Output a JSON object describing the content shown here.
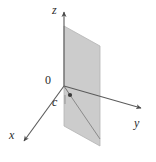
{
  "figure": {
    "kind": "3d-coordinate-plane-diagram",
    "background_color": "#ffffff",
    "stroke_color": "#5a5a5a",
    "label_color": "#2b2b2b",
    "plane_fill_color": "#c9c9c9",
    "plane_edge_color": "#b0b0b0",
    "labels": {
      "z_axis": "z",
      "y_axis": "y",
      "x_axis": "x",
      "origin": "0",
      "point_c": "c"
    },
    "geometry": {
      "origin_px": [
        64,
        86
      ],
      "z_axis_tip_px": [
        64,
        10
      ],
      "y_axis_tip_px": [
        143,
        108
      ],
      "x_axis_tip_px": [
        22,
        143
      ],
      "point_c_px": [
        70,
        95
      ],
      "plane_vertices_px": [
        [
          64,
          26
        ],
        [
          100,
          46
        ],
        [
          100,
          146
        ],
        [
          64,
          126
        ]
      ]
    }
  }
}
